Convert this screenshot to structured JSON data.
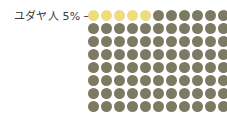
{
  "annotation": {
    "label": "ユダヤ人 5%",
    "arrow": "→",
    "arrow_icon_name": "arrow-right-icon"
  },
  "colors": {
    "background": "#ffffff",
    "highlight": "#f0dc80",
    "base": "#7d7a63",
    "text": "#3a3a3a"
  },
  "chart_data": {
    "type": "table",
    "title": "",
    "subtitle": "",
    "xlabel": "",
    "ylabel": "",
    "grid": false,
    "legend_position": "none",
    "annotations": [
      {
        "text": "ユダヤ人 5%",
        "arrow": "→",
        "points_to": "row 1, first highlighted dots",
        "position": "left-of-grid"
      }
    ],
    "categories": [
      "ユダヤ人",
      "その他"
    ],
    "values": [
      5,
      95
    ],
    "units": "percent",
    "dot_value": 1,
    "columns": 11,
    "rows": 9,
    "highlight_count": 5,
    "highlight_color": "#f0dc80",
    "base_color": "#7d7a63",
    "rows_data": [
      [
        "highlight",
        "highlight",
        "highlight",
        "highlight",
        "highlight",
        "base",
        "base",
        "base",
        "base",
        "base",
        "base"
      ],
      [
        "base",
        "base",
        "base",
        "base",
        "base",
        "base",
        "base",
        "base",
        "base",
        "base",
        "base"
      ],
      [
        "base",
        "base",
        "base",
        "base",
        "base",
        "base",
        "base",
        "base",
        "base",
        "base",
        "base"
      ],
      [
        "base",
        "base",
        "base",
        "base",
        "base",
        "base",
        "base",
        "base",
        "base",
        "base",
        "base"
      ],
      [
        "base",
        "base",
        "base",
        "base",
        "base",
        "base",
        "base",
        "base",
        "base",
        "base",
        "base"
      ],
      [
        "base",
        "base",
        "base",
        "base",
        "base",
        "base",
        "base",
        "base",
        "base",
        "base",
        "base"
      ],
      [
        "base",
        "base",
        "base",
        "base",
        "base",
        "base",
        "base",
        "base",
        "base",
        "base",
        "base"
      ],
      [
        "base",
        "base",
        "base",
        "base",
        "base",
        "base",
        "base",
        "base",
        "base",
        "base",
        "base"
      ],
      [
        "base",
        "base",
        "base",
        "base",
        "base",
        "base",
        "base",
        "base",
        "base",
        "base",
        "base"
      ]
    ]
  }
}
